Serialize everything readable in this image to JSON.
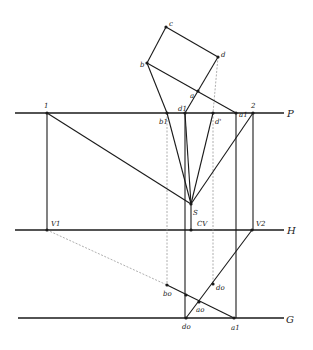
{
  "diagram": {
    "colors": {
      "ink": "#1a1a1a",
      "faint": "#9a9a9a",
      "paper": "#ffffff"
    },
    "reference_lines": [
      {
        "id": "P",
        "label": "P",
        "x1": 15,
        "y1": 113,
        "x2": 284,
        "y2": 113,
        "label_x": 287,
        "label_y": 117
      },
      {
        "id": "H",
        "label": "H",
        "x1": 15,
        "y1": 230,
        "x2": 284,
        "y2": 230,
        "label_x": 287,
        "label_y": 234
      },
      {
        "id": "G",
        "label": "G",
        "x1": 18,
        "y1": 318,
        "x2": 284,
        "y2": 318,
        "label_x": 286,
        "label_y": 323
      }
    ],
    "points": [
      {
        "id": "c",
        "label": "c",
        "x": 166,
        "y": 27,
        "lx": 169,
        "ly": 26
      },
      {
        "id": "d",
        "label": "d",
        "x": 218,
        "y": 57,
        "lx": 221,
        "ly": 57
      },
      {
        "id": "b",
        "label": "b",
        "x": 147,
        "y": 63,
        "lx": 140,
        "ly": 67
      },
      {
        "id": "a",
        "label": "a",
        "x": 198,
        "y": 91,
        "lx": 190,
        "ly": 98
      },
      {
        "id": "1",
        "label": "1",
        "x": 47,
        "y": 113,
        "lx": 44,
        "ly": 108
      },
      {
        "id": "2",
        "label": "2",
        "x": 253,
        "y": 113,
        "lx": 251,
        "ly": 108
      },
      {
        "id": "b1",
        "label": "b1",
        "x": 167,
        "y": 113,
        "lx": 159,
        "ly": 124
      },
      {
        "id": "d1",
        "label": "d1",
        "x": 185,
        "y": 113,
        "lx": 178,
        "ly": 111
      },
      {
        "id": "dprime",
        "label": "d'",
        "x": 213,
        "y": 113,
        "lx": 215,
        "ly": 124
      },
      {
        "id": "a1",
        "label": "a1",
        "x": 236,
        "y": 113,
        "lx": 239,
        "ly": 117
      },
      {
        "id": "S",
        "label": "S",
        "x": 191,
        "y": 204,
        "lx": 193,
        "ly": 215
      },
      {
        "id": "CV",
        "label": "CV",
        "x": 191,
        "y": 230,
        "lx": 197,
        "ly": 226
      },
      {
        "id": "V1",
        "label": "V1",
        "x": 47,
        "y": 230,
        "lx": 51,
        "ly": 226
      },
      {
        "id": "V2",
        "label": "V2",
        "x": 252,
        "y": 230,
        "lx": 256,
        "ly": 226
      },
      {
        "id": "bo",
        "label": "bo",
        "x": 167,
        "y": 285,
        "lx": 163,
        "ly": 296
      },
      {
        "id": "x_mid",
        "label": "",
        "x": 186,
        "y": 295,
        "lx": 0,
        "ly": 0
      },
      {
        "id": "ao",
        "label": "ao",
        "x": 199,
        "y": 302,
        "lx": 196,
        "ly": 312
      },
      {
        "id": "do",
        "label": "do",
        "x": 213,
        "y": 284,
        "lx": 216,
        "ly": 290
      },
      {
        "id": "d0",
        "label": "do",
        "x": 186,
        "y": 318,
        "lx": 182,
        "ly": 329
      },
      {
        "id": "a1g",
        "label": "a1",
        "x": 234,
        "y": 318,
        "lx": 231,
        "ly": 330
      }
    ],
    "solid_segments": [
      [
        166,
        27,
        218,
        57
      ],
      [
        166,
        27,
        147,
        63
      ],
      [
        218,
        57,
        185,
        113
      ],
      [
        147,
        63,
        236,
        113
      ],
      [
        147,
        63,
        167,
        113
      ],
      [
        47,
        113,
        47,
        230
      ],
      [
        253,
        113,
        253,
        230
      ],
      [
        47,
        113,
        191,
        204
      ],
      [
        253,
        113,
        191,
        204
      ],
      [
        167,
        113,
        191,
        204
      ],
      [
        185,
        113,
        191,
        204
      ],
      [
        213,
        113,
        191,
        204
      ],
      [
        236,
        113,
        236,
        318
      ],
      [
        185,
        113,
        185,
        318
      ],
      [
        191,
        204,
        191,
        230
      ],
      [
        252,
        230,
        186,
        318
      ],
      [
        167,
        285,
        234,
        318
      ]
    ],
    "faint_segments": [
      [
        218,
        57,
        213,
        113
      ],
      [
        167,
        113,
        167,
        285
      ],
      [
        213,
        113,
        213,
        284
      ],
      [
        47,
        230,
        167,
        285
      ]
    ]
  }
}
